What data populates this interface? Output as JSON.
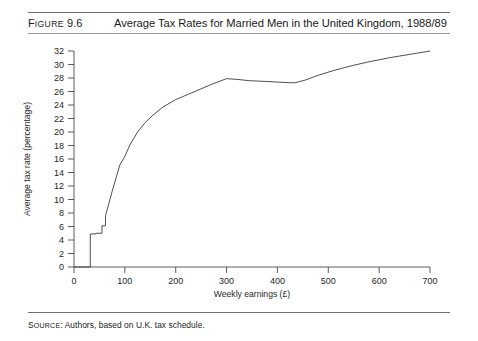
{
  "figure": {
    "label_prefix": "F",
    "label_small": "IGURE",
    "label_number": " 9.6",
    "label_full": "FIGURE 9.6",
    "title": "Average Tax Rates for Married Men in the United Kingdom, 1988/89"
  },
  "source": {
    "prefix_big": "S",
    "prefix_small": "OURCE",
    "text": ": Authors, based on U.K. tax schedule.",
    "full": "SOURCE: Authors, based on U.K. tax schedule."
  },
  "colors": {
    "curve": "#3b3b3b",
    "axis": "#4a4a4a",
    "rule": "#6e6e6e",
    "text": "#1a1a1a",
    "background": "#ffffff"
  },
  "chart_data": {
    "type": "line",
    "title": "Average Tax Rates for Married Men in the United Kingdom, 1988/89",
    "xlabel": "Weekly earnings (£)",
    "ylabel": "Average tax rate (percentage)",
    "xlim": [
      0,
      700
    ],
    "ylim": [
      0,
      32
    ],
    "xticks": [
      0,
      100,
      200,
      300,
      400,
      500,
      600,
      700
    ],
    "xtick_labels": [
      "0",
      "100",
      "200",
      "300",
      "400",
      "500",
      "600",
      "700"
    ],
    "yticks": [
      0,
      2,
      4,
      6,
      8,
      10,
      12,
      14,
      16,
      18,
      20,
      22,
      24,
      26,
      28,
      30,
      32
    ],
    "ytick_labels": [
      "0",
      "2",
      "4",
      "6",
      "8",
      "10",
      "12",
      "14",
      "16",
      "18",
      "20",
      "22",
      "24",
      "26",
      "28",
      "30",
      "32"
    ],
    "grid": false,
    "legend": false,
    "series": [
      {
        "name": "Average tax rate",
        "x": [
          0,
          32,
          32,
          43,
          43,
          55,
          55,
          62,
          62,
          75,
          90,
          100,
          103,
          110,
          125,
          140,
          155,
          175,
          200,
          225,
          250,
          275,
          300,
          320,
          345,
          375,
          400,
          425,
          435,
          455,
          480,
          510,
          545,
          580,
          620,
          660,
          700
        ],
        "y": [
          0,
          0,
          4.9,
          4.9,
          5.0,
          5.0,
          6.1,
          6.1,
          7.6,
          11.2,
          15.1,
          16.4,
          16.9,
          18.1,
          20.0,
          21.4,
          22.5,
          23.7,
          24.8,
          25.6,
          26.4,
          27.2,
          27.9,
          27.8,
          27.6,
          27.5,
          27.4,
          27.3,
          27.3,
          27.7,
          28.4,
          29.1,
          29.8,
          30.4,
          31.0,
          31.5,
          32.0
        ]
      }
    ],
    "annotations": [
      {
        "label": "zero-rate band below personal allowance",
        "x_range": [
          0,
          32
        ],
        "value": 0
      },
      {
        "label": "first step",
        "x": 43,
        "value": 4.9
      },
      {
        "label": "second step",
        "x": 62,
        "value": 6.1
      },
      {
        "label": "local peak",
        "x": 300,
        "value": 27.9
      },
      {
        "label": "local trough",
        "x": 430,
        "value": 27.3
      },
      {
        "label": "endpoint",
        "x": 700,
        "value": 32.0
      }
    ]
  }
}
